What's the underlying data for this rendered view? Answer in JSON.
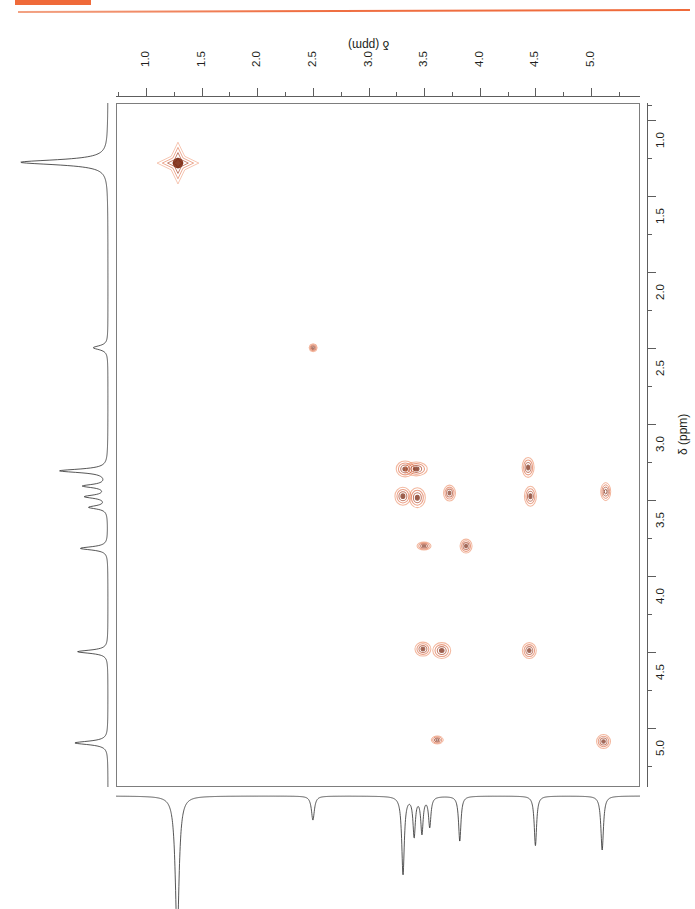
{
  "page": {
    "background_color": "#ffffff",
    "accent_color": "#ef6a3a",
    "ink_color": "#231f20"
  },
  "header": {
    "tag_block_color": "#ef6a3a",
    "rule_color": "#ef7044"
  },
  "figure": {
    "experiment_label": "OSY",
    "plot_type": "2D NMR COSY contour plot"
  },
  "axes": {
    "top": {
      "title": "δ (ppm)",
      "orientation": "inverted",
      "tick_labels": [
        "1.0",
        "1.5",
        "2.0",
        "2.5",
        "3.0",
        "3.5",
        "4.0",
        "4.5",
        "5.0"
      ],
      "tick_values": [
        1.0,
        1.5,
        2.0,
        2.5,
        3.0,
        3.5,
        4.0,
        4.5,
        5.0
      ],
      "range": [
        0.73,
        5.44
      ],
      "direction": "increasing-left-to-right"
    },
    "right": {
      "title": "δ (ppm)",
      "tick_labels": [
        "1.0",
        "1.5",
        "2.0",
        "2.5",
        "3.0",
        "3.5",
        "4.0",
        "4.5",
        "5.0"
      ],
      "tick_values": [
        1.0,
        1.5,
        2.0,
        2.5,
        3.0,
        3.5,
        4.0,
        4.5,
        5.0
      ],
      "range": [
        0.89,
        5.39
      ],
      "direction": "increasing-top-to-bottom"
    }
  },
  "chart_data": {
    "type": "scatter",
    "title": "",
    "subtitle": "",
    "xlabel": "δ (ppm)",
    "ylabel": "δ (ppm)",
    "xlim": [
      0.73,
      5.44
    ],
    "ylim": [
      0.89,
      5.39
    ],
    "grid": false,
    "legend": "none",
    "contour_colors": [
      "#e8713f",
      "#d9562a",
      "#a33a1c",
      "#7d2b14"
    ],
    "series": [
      {
        "name": "diagonal peaks",
        "points": [
          {
            "x": 1.28,
            "y": 1.28,
            "rx": 11,
            "ry": 11,
            "intensity": 1.0,
            "shape": "star"
          },
          {
            "x": 2.5,
            "y": 2.5,
            "rx": 4,
            "ry": 4,
            "intensity": 0.22,
            "shape": "ring"
          },
          {
            "x": 3.33,
            "y": 3.3,
            "rx": 9,
            "ry": 8,
            "intensity": 0.8,
            "shape": "blob"
          },
          {
            "x": 3.43,
            "y": 3.3,
            "rx": 11,
            "ry": 7,
            "intensity": 0.85,
            "shape": "blob"
          },
          {
            "x": 3.31,
            "y": 3.48,
            "rx": 8,
            "ry": 9,
            "intensity": 0.78,
            "shape": "blob"
          },
          {
            "x": 3.44,
            "y": 3.49,
            "rx": 8,
            "ry": 10,
            "intensity": 0.8,
            "shape": "blob"
          },
          {
            "x": 3.73,
            "y": 3.46,
            "rx": 6,
            "ry": 8,
            "intensity": 0.55,
            "shape": "blob"
          },
          {
            "x": 4.44,
            "y": 3.29,
            "rx": 6,
            "ry": 10,
            "intensity": 0.7,
            "shape": "blob"
          },
          {
            "x": 4.46,
            "y": 3.48,
            "rx": 6,
            "ry": 10,
            "intensity": 0.7,
            "shape": "blob"
          },
          {
            "x": 5.14,
            "y": 3.45,
            "rx": 5,
            "ry": 9,
            "intensity": 0.45,
            "shape": "ring"
          },
          {
            "x": 3.5,
            "y": 3.81,
            "rx": 7,
            "ry": 4,
            "intensity": 0.45,
            "shape": "blob"
          },
          {
            "x": 3.88,
            "y": 3.81,
            "rx": 6,
            "ry": 7,
            "intensity": 0.6,
            "shape": "blob"
          },
          {
            "x": 3.49,
            "y": 4.49,
            "rx": 8,
            "ry": 7,
            "intensity": 0.68,
            "shape": "blob"
          },
          {
            "x": 3.66,
            "y": 4.5,
            "rx": 9,
            "ry": 8,
            "intensity": 0.72,
            "shape": "blob"
          },
          {
            "x": 4.45,
            "y": 4.5,
            "rx": 7,
            "ry": 8,
            "intensity": 0.62,
            "shape": "blob"
          },
          {
            "x": 3.62,
            "y": 5.09,
            "rx": 6,
            "ry": 4,
            "intensity": 0.35,
            "shape": "ring"
          },
          {
            "x": 5.12,
            "y": 5.1,
            "rx": 7,
            "ry": 7,
            "intensity": 0.58,
            "shape": "blob"
          }
        ]
      }
    ],
    "projection_top_trace": "1D proton spectrum, peaks inverted (downward)",
    "projection_left_trace": "1D proton spectrum, peaks pointing left",
    "projection_peaks_ppm": [
      1.28,
      2.5,
      3.31,
      3.45,
      3.52,
      3.82,
      4.5,
      5.1
    ]
  }
}
